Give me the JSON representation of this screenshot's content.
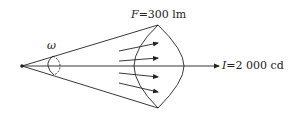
{
  "diagram": {
    "flux_label": {
      "symbol": "F",
      "text": "=300 lm"
    },
    "intensity_label": {
      "symbol": "I",
      "text": "=2 000 cd"
    },
    "solid_angle_label": "ω",
    "colors": {
      "line": "#222222",
      "background": "#ffffff"
    }
  }
}
